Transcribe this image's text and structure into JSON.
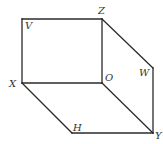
{
  "diagram": {
    "type": "3d-prism-wireframe",
    "points": {
      "V": {
        "x": 22,
        "y": 19
      },
      "Z": {
        "x": 102,
        "y": 19
      },
      "X": {
        "x": 22,
        "y": 83
      },
      "O": {
        "x": 102,
        "y": 83
      },
      "W": {
        "x": 153,
        "y": 68
      },
      "H": {
        "x": 72,
        "y": 133
      },
      "Y": {
        "x": 153,
        "y": 133
      }
    },
    "labels": [
      {
        "id": "V",
        "text": "V",
        "x": 25,
        "y": 29
      },
      {
        "id": "Z",
        "text": "Z",
        "x": 98,
        "y": 14
      },
      {
        "id": "X",
        "text": "X",
        "x": 9,
        "y": 87
      },
      {
        "id": "O",
        "text": "O",
        "x": 105,
        "y": 81
      },
      {
        "id": "W",
        "text": "W",
        "x": 139,
        "y": 76
      },
      {
        "id": "H",
        "text": "H",
        "x": 73,
        "y": 131
      },
      {
        "id": "Y",
        "text": "Y",
        "x": 155,
        "y": 139
      }
    ],
    "edges": [
      [
        "V",
        "Z"
      ],
      [
        "V",
        "X"
      ],
      [
        "Z",
        "O"
      ],
      [
        "X",
        "O"
      ],
      [
        "Z",
        "W"
      ],
      [
        "W",
        "Y"
      ],
      [
        "O",
        "Y"
      ],
      [
        "X",
        "H"
      ],
      [
        "H",
        "Y"
      ]
    ]
  }
}
